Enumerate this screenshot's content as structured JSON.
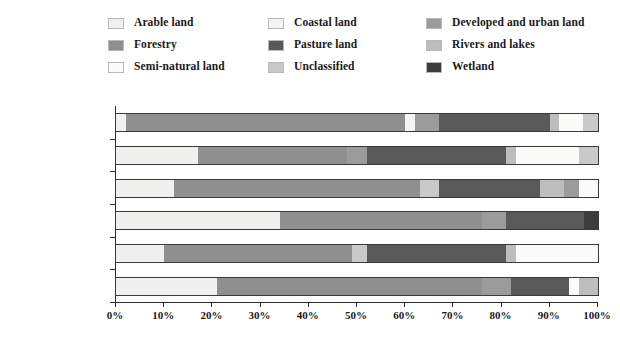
{
  "chart_data": {
    "type": "bar",
    "orientation": "horizontal",
    "stacked": true,
    "title": "",
    "xlabel": "",
    "ylabel": "",
    "xlim": [
      0,
      100
    ],
    "grid": false,
    "legend_position": "top",
    "xticks": [
      "0%",
      "10%",
      "20%",
      "30%",
      "40%",
      "50%",
      "60%",
      "70%",
      "80%",
      "90%",
      "100%"
    ],
    "xtick_values": [
      0,
      10,
      20,
      30,
      40,
      50,
      60,
      70,
      80,
      90,
      100
    ],
    "categories": [
      "North West",
      "North East",
      "West Midlands",
      "East Midlands",
      "South West",
      "South East"
    ],
    "series": [
      {
        "name": "Arable land",
        "color": "#f0f0ef",
        "values": [
          2,
          17,
          12,
          34,
          10,
          21
        ]
      },
      {
        "name": "Forestry",
        "color": "#8f8f8f",
        "values": [
          58,
          31,
          51,
          42,
          39,
          55
        ]
      },
      {
        "name": "Coastal land",
        "color": "#f4f4f3",
        "values": [
          1,
          0,
          0,
          0,
          0,
          0
        ]
      },
      {
        "name": "Pasture land",
        "color": "#595959",
        "values": [
          22,
          30,
          18,
          17,
          29,
          13
        ]
      },
      {
        "name": "Developed and urban land",
        "color": "#9b9b9b",
        "values": [
          7,
          4,
          3,
          5,
          3,
          6
        ]
      },
      {
        "name": "Rivers and lakes",
        "color": "#bdbdbd",
        "values": [
          2,
          2,
          2,
          1,
          1,
          1
        ]
      },
      {
        "name": "Semi-natural land",
        "color": "#fbfbfa",
        "values": [
          4,
          14,
          10,
          0,
          17,
          2
        ]
      },
      {
        "name": "Unclassified",
        "color": "#c9c9c9",
        "values": [
          3,
          2,
          3,
          0,
          0,
          2
        ]
      },
      {
        "name": "Wetland",
        "color": "#3d3d3d",
        "values": [
          1,
          0,
          1,
          1,
          1,
          0
        ]
      }
    ],
    "bars": [
      {
        "category": "North West",
        "segments": [
          {
            "series": "Arable land",
            "start": 0,
            "end": 2
          },
          {
            "series": "Forestry",
            "start": 2,
            "end": 60
          },
          {
            "series": "Coastal land",
            "start": 60,
            "end": 62
          },
          {
            "series": "Developed and urban land",
            "start": 62,
            "end": 67
          },
          {
            "series": "Pasture land",
            "start": 67,
            "end": 90
          },
          {
            "series": "Rivers and lakes",
            "start": 90,
            "end": 92
          },
          {
            "series": "Semi-natural land",
            "start": 92,
            "end": 97
          },
          {
            "series": "Unclassified",
            "start": 97,
            "end": 100
          }
        ]
      },
      {
        "category": "North East",
        "segments": [
          {
            "series": "Arable land",
            "start": 0,
            "end": 17
          },
          {
            "series": "Forestry",
            "start": 17,
            "end": 48
          },
          {
            "series": "Developed and urban land",
            "start": 48,
            "end": 52
          },
          {
            "series": "Pasture land",
            "start": 52,
            "end": 81
          },
          {
            "series": "Rivers and lakes",
            "start": 81,
            "end": 83
          },
          {
            "series": "Semi-natural land",
            "start": 83,
            "end": 96
          },
          {
            "series": "Unclassified",
            "start": 96,
            "end": 100
          }
        ]
      },
      {
        "category": "West Midlands",
        "segments": [
          {
            "series": "Arable land",
            "start": 0,
            "end": 12
          },
          {
            "series": "Forestry",
            "start": 12,
            "end": 63
          },
          {
            "series": "Unclassified",
            "start": 63,
            "end": 67
          },
          {
            "series": "Pasture land",
            "start": 67,
            "end": 88
          },
          {
            "series": "Rivers and lakes",
            "start": 88,
            "end": 93
          },
          {
            "series": "Developed and urban land",
            "start": 93,
            "end": 96
          },
          {
            "series": "Semi-natural land",
            "start": 96,
            "end": 100
          }
        ]
      },
      {
        "category": "East Midlands",
        "segments": [
          {
            "series": "Arable land",
            "start": 0,
            "end": 34
          },
          {
            "series": "Forestry",
            "start": 34,
            "end": 76
          },
          {
            "series": "Developed and urban land",
            "start": 76,
            "end": 81
          },
          {
            "series": "Pasture land",
            "start": 81,
            "end": 97
          },
          {
            "series": "Wetland",
            "start": 97,
            "end": 100
          }
        ]
      },
      {
        "category": "South West",
        "segments": [
          {
            "series": "Arable land",
            "start": 0,
            "end": 10
          },
          {
            "series": "Forestry",
            "start": 10,
            "end": 49
          },
          {
            "series": "Unclassified",
            "start": 49,
            "end": 52
          },
          {
            "series": "Pasture land",
            "start": 52,
            "end": 81
          },
          {
            "series": "Rivers and lakes",
            "start": 81,
            "end": 83
          },
          {
            "series": "Semi-natural land",
            "start": 83,
            "end": 100
          }
        ]
      },
      {
        "category": "South East",
        "segments": [
          {
            "series": "Arable land",
            "start": 0,
            "end": 21
          },
          {
            "series": "Forestry",
            "start": 21,
            "end": 76
          },
          {
            "series": "Developed and urban land",
            "start": 76,
            "end": 82
          },
          {
            "series": "Pasture land",
            "start": 82,
            "end": 94
          },
          {
            "series": "Semi-natural land",
            "start": 94,
            "end": 96
          },
          {
            "series": "Rivers and lakes",
            "start": 96,
            "end": 100
          }
        ]
      }
    ]
  },
  "legend": {
    "columns": [
      [
        {
          "label": "Arable land",
          "color": "#f0f0ef",
          "icon": "legend-swatch-arable-land"
        },
        {
          "label": "Forestry",
          "color": "#8f8f8f",
          "icon": "legend-swatch-forestry"
        },
        {
          "label": "Semi-natural land",
          "color": "#fbfbfa",
          "icon": "legend-swatch-semi-natural-land"
        }
      ],
      [
        {
          "label": "Coastal land",
          "color": "#f4f4f3",
          "icon": "legend-swatch-coastal-land"
        },
        {
          "label": "Pasture land",
          "color": "#595959",
          "icon": "legend-swatch-pasture-land"
        },
        {
          "label": "Unclassified",
          "color": "#c9c9c9",
          "icon": "legend-swatch-unclassified"
        }
      ],
      [
        {
          "label": "Developed and urban land",
          "color": "#9b9b9b",
          "icon": "legend-swatch-developed-and-urban-land"
        },
        {
          "label": "Rivers and lakes",
          "color": "#bdbdbd",
          "icon": "legend-swatch-rivers-and-lakes"
        },
        {
          "label": "Wetland",
          "color": "#3d3d3d",
          "icon": "legend-swatch-wetland"
        }
      ]
    ]
  }
}
